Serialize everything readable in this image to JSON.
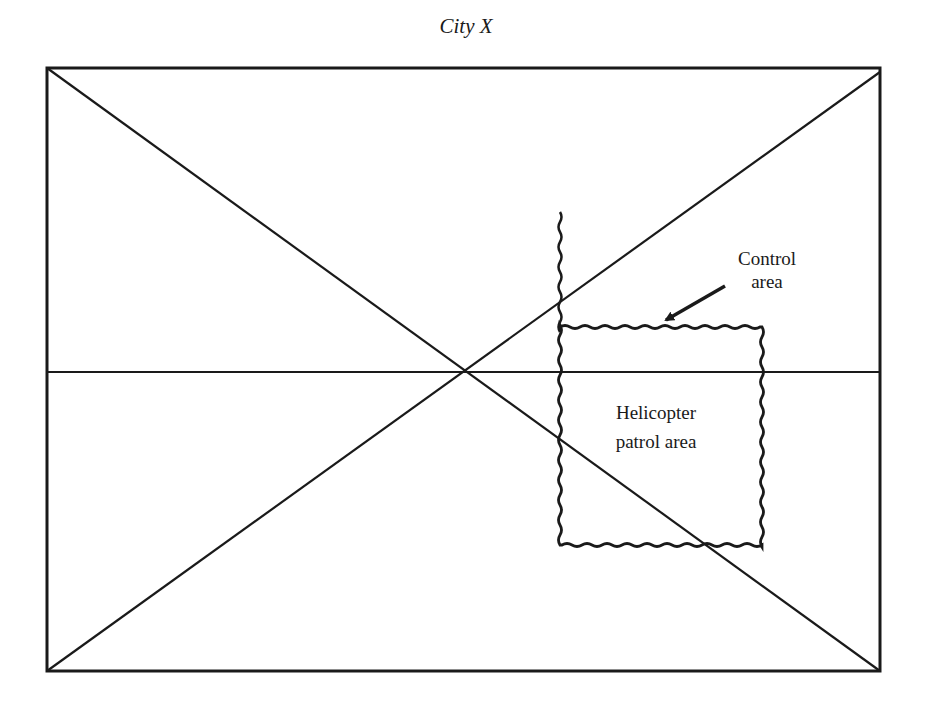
{
  "diagram": {
    "title": "City X",
    "labels": {
      "control_area_line1": "Control",
      "control_area_line2": "area",
      "patrol_area_line1": "Helicopter",
      "patrol_area_line2": "patrol area"
    },
    "colors": {
      "ink": "#1a1a1a",
      "background": "#ffffff"
    }
  }
}
